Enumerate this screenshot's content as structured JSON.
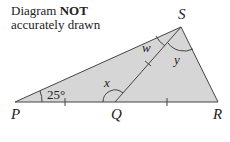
{
  "note": {
    "line1_prefix": "Diagram ",
    "line1_bold": "NOT",
    "line2": "accurately drawn"
  },
  "vertices": {
    "P": "P",
    "Q": "Q",
    "R": "R",
    "S": "S"
  },
  "angles": {
    "PSQ": "w",
    "PQS": "x",
    "QSR": "y",
    "SPQ": "25°"
  },
  "colors": {
    "fill": "#d6d6d6",
    "stroke": "#444444"
  }
}
